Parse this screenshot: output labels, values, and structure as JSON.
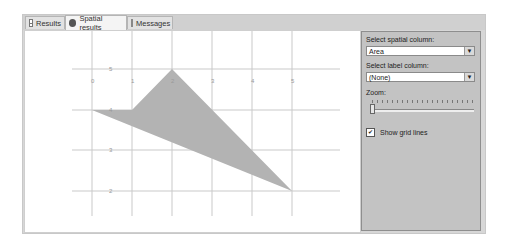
{
  "tabs": [
    {
      "label": "Results",
      "icon": "grid-icon",
      "active": false
    },
    {
      "label": "Spatial results",
      "icon": "globe-icon",
      "active": true
    },
    {
      "label": "Messages",
      "icon": "message-icon",
      "active": false
    }
  ],
  "side_panel": {
    "spatial_column_label": "Select spatial column:",
    "spatial_column_value": "Area",
    "label_column_label": "Select label column:",
    "label_column_value": "(None)",
    "zoom_label": "Zoom:",
    "zoom_value": 0,
    "show_grid_lines_label": "Show grid lines",
    "show_grid_lines_checked": true
  },
  "plot": {
    "x_ticks": [
      "0",
      "1",
      "2",
      "3",
      "4",
      "5"
    ],
    "y_ticks": [
      "5",
      "4",
      "3",
      "2"
    ],
    "polygon": [
      [
        0,
        4
      ],
      [
        1,
        4
      ],
      [
        2,
        5
      ],
      [
        5,
        2
      ]
    ],
    "fill_color": "#b3b3b3",
    "grid_color": "#c9c9c9"
  }
}
